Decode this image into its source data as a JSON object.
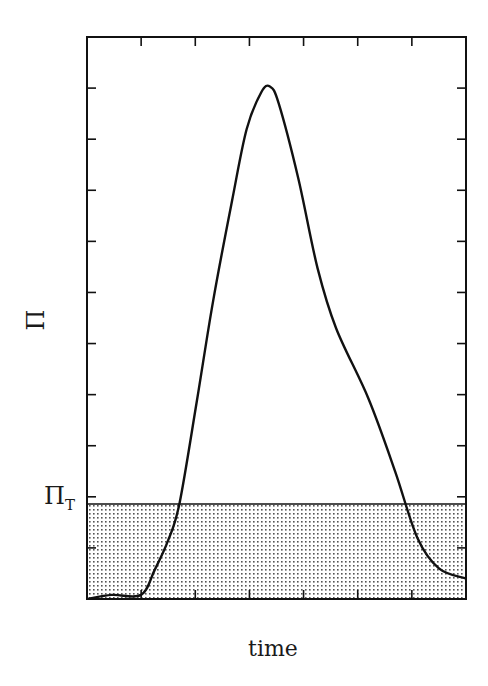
{
  "chart_data": {
    "type": "area",
    "title": "",
    "xlabel": "time",
    "ylabel": "Π",
    "xlim": [
      0,
      7
    ],
    "ylim": [
      0,
      11
    ],
    "x_ticks": [
      0,
      1,
      2,
      3,
      4,
      5,
      6,
      7
    ],
    "y_ticks": [
      1,
      2,
      3,
      4,
      5,
      6,
      7,
      8,
      9,
      10
    ],
    "tick_labels_shown": false,
    "grid": false,
    "legend": null,
    "threshold": {
      "label": "Π",
      "label_subscript": "T",
      "value": 1.86,
      "fill": "dotted shading below threshold"
    },
    "series": [
      {
        "name": "Π",
        "x": [
          0,
          0.46,
          1.0,
          1.25,
          1.5,
          1.71,
          2.03,
          2.33,
          2.68,
          2.95,
          3.22,
          3.38,
          3.54,
          3.9,
          4.26,
          4.6,
          5.2,
          5.69,
          6.1,
          6.5,
          7.0
        ],
        "y": [
          0,
          0.08,
          0.08,
          0.57,
          1.15,
          1.88,
          3.88,
          5.84,
          7.8,
          9.2,
          9.92,
          10.03,
          9.7,
          8.24,
          6.47,
          5.3,
          3.92,
          2.5,
          1.2,
          0.6,
          0.4
        ]
      }
    ],
    "annotations": [
      {
        "text": "Π_T",
        "position": "left of y-axis at threshold level"
      }
    ]
  },
  "labels": {
    "y_axis": "Π",
    "x_axis": "time",
    "threshold_main": "Π",
    "threshold_sub": "T"
  },
  "colors": {
    "line": "#111111",
    "frame": "#111111",
    "dots": "#555555",
    "background": "#ffffff"
  }
}
